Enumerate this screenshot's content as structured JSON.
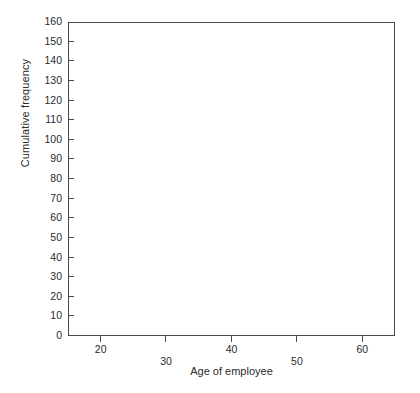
{
  "chart_data": {
    "type": "line",
    "title": "",
    "xlabel": "Age of employee",
    "ylabel": "Cumulative frequency",
    "x": [
      20,
      30,
      40,
      50,
      60
    ],
    "values": [
      11,
      74,
      120,
      142,
      152
    ],
    "series": [
      {
        "name": "Cumulative frequency",
        "values": [
          11,
          74,
          120,
          142,
          152
        ]
      }
    ],
    "xlim": [
      15,
      65
    ],
    "ylim": [
      0,
      160
    ],
    "xticks": [
      20,
      30,
      40,
      50,
      60
    ],
    "yticks": [
      0,
      10,
      20,
      30,
      40,
      50,
      60,
      70,
      80,
      90,
      100,
      110,
      120,
      130,
      140,
      150,
      160
    ],
    "xtick_labels": [
      "20",
      "30",
      "40",
      "50",
      "60"
    ],
    "ytick_labels": [
      "0",
      "10",
      "20",
      "30",
      "40",
      "50",
      "60",
      "70",
      "80",
      "90",
      "100",
      "110",
      "120",
      "130",
      "140",
      "150",
      "160"
    ],
    "grid": false,
    "legend": null,
    "marker": "square",
    "line_color": "#111111",
    "marker_color": "#111111",
    "frame_color": "#4a4a4a",
    "background": "#ffffff"
  },
  "caption": ""
}
